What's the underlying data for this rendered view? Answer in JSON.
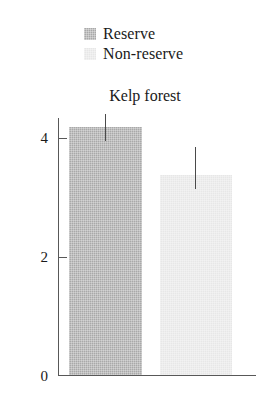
{
  "chart_data": {
    "type": "bar",
    "title": "Kelp forest",
    "xlabel": "",
    "ylabel": "",
    "categories": [
      "Kelp forest"
    ],
    "ylim": [
      0,
      4.55
    ],
    "yticks": [
      0,
      2,
      4
    ],
    "ytick_labels": [
      "0",
      "2",
      "4"
    ],
    "grid": false,
    "legend_position": "top-center",
    "series": [
      {
        "name": "Reserve",
        "values": [
          4.18
        ],
        "errors_upper": [
          0.22
        ],
        "error_top_values": [
          4.4
        ],
        "color": "#a9a9a9"
      },
      {
        "name": "Non-reserve",
        "values": [
          3.38
        ],
        "errors_upper": [
          0.47
        ],
        "error_top_values": [
          3.85
        ],
        "color": "#e7e7e7"
      }
    ]
  },
  "legend": {
    "items": [
      {
        "label": "Reserve",
        "swatch_color": "#a9a9a9"
      },
      {
        "label": "Non-reserve",
        "swatch_color": "#e7e7e7"
      }
    ]
  },
  "axis": {
    "ticks": [
      {
        "label": "4"
      },
      {
        "label": "2"
      },
      {
        "label": "0"
      }
    ],
    "line_color": "#585858"
  },
  "colors": {
    "background": "#ffffff",
    "text": "#1a1a1a",
    "axis": "#585858",
    "errorbar": "#4a4a4a",
    "bar_reserve": "#a9a9a9",
    "bar_non_reserve": "#e7e7e7"
  }
}
